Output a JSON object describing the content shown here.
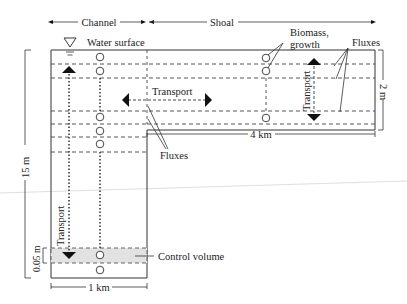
{
  "diagram": {
    "labels": {
      "channel": "Channel",
      "shoal": "Shoal",
      "water_surface": "Water surface",
      "biomass_line1": "Biomass,",
      "biomass_line2": "growth",
      "fluxes_top": "Fluxes",
      "fluxes_bottom": "Fluxes",
      "transport_horizontal": "Transport",
      "transport_shoal_vertical": "Transport",
      "transport_channel_vertical": "Transport",
      "control_volume": "Control volume"
    },
    "dimensions": {
      "channel_depth": "15 m",
      "shoal_depth": "2 m",
      "shoal_length": "4 km",
      "channel_width": "1 km",
      "control_volume_thickness": "0.05 m"
    },
    "colors": {
      "line": "#333333",
      "control_volume_fill": "#e2e2e2",
      "arrow": "#111111"
    }
  }
}
